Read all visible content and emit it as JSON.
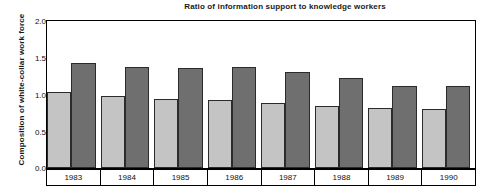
{
  "chart_data": {
    "type": "bar",
    "title": "Ratio of information support to knowledge workers",
    "xlabel": "",
    "ylabel": "Composition of white-collar work force",
    "categories": [
      "1983",
      "1984",
      "1985",
      "1986",
      "1987",
      "1988",
      "1989",
      "1990"
    ],
    "series": [
      {
        "name": "light-bar",
        "color": "#c4c4c4",
        "values": [
          1.03,
          0.98,
          0.94,
          0.93,
          0.88,
          0.84,
          0.81,
          0.8
        ]
      },
      {
        "name": "dark-bar",
        "color": "#6f6f6f",
        "values": [
          1.43,
          1.38,
          1.36,
          1.37,
          1.31,
          1.22,
          1.12,
          1.12
        ]
      }
    ],
    "ylim": [
      0.0,
      2.0
    ],
    "yticks": [
      "0.0",
      "0.5",
      "1.0",
      "1.5",
      "2.0"
    ],
    "ytick_values": [
      0.0,
      0.5,
      1.0,
      1.5,
      2.0
    ],
    "grid": false,
    "legend": "none"
  },
  "colors": {
    "light_bar": "#c4c4c4",
    "dark_bar": "#6f6f6f",
    "axis": "#000000",
    "text": "#1a1a1a",
    "background": "#ffffff"
  }
}
